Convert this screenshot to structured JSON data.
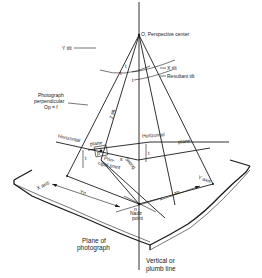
{
  "diagram": {
    "labels": {
      "perspective_center": "O, Perspective center",
      "y_tilt": "Y tilt",
      "x_tilt": "X tilt",
      "resultant_tilt": "Resultant tilt",
      "photo_perp_1": "Photograph",
      "photo_perp_2": "perpendicular",
      "photo_perp_3": "Op = f",
      "tx_top": "t",
      "ty_top": "t",
      "t_center": "t",
      "horizontal_left": "Horizontal",
      "plane_left": "plane",
      "horizontal_right": "Horizontal",
      "plane_right": "plane",
      "tilt_along": "Z tilt",
      "ty_side": "t",
      "tx_side": "t",
      "principal_1": "Prin-",
      "principal_2": "cipal point",
      "p_label": "p",
      "s_swing": "s",
      "swing": "Swing",
      "x_axis": "X axis",
      "y_axis": "Y axis",
      "yn": "Yn",
      "xn": "xn",
      "n_label": "n",
      "nadir_1": "Nadir",
      "nadir_2": "point",
      "plane_photo_1": "Plane of",
      "plane_photo_2": "photograph",
      "vertical_1": "Vertical or",
      "vertical_2": "plumb line"
    }
  }
}
